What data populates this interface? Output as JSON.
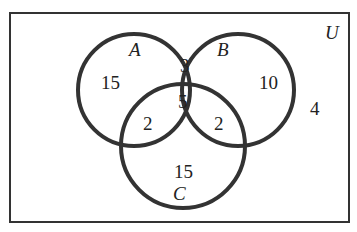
{
  "diagram": {
    "type": "venn-3-set",
    "universe_label": "U",
    "sets": [
      {
        "label": "A"
      },
      {
        "label": "B"
      },
      {
        "label": "C"
      }
    ],
    "regions": {
      "A_only": "15",
      "B_only": "10",
      "C_only": "15",
      "A_and_B_only": "3",
      "A_and_C_only": "2",
      "B_and_C_only": "2",
      "A_and_B_and_C": "5",
      "outside": "4"
    },
    "colors": {
      "stroke": "#333333",
      "text": "#222222",
      "background": "#ffffff"
    }
  }
}
